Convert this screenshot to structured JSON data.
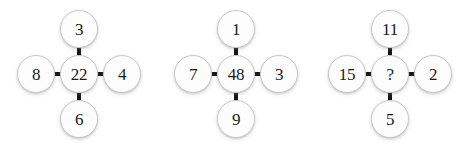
{
  "puzzle": {
    "type": "number-cross-puzzle",
    "background_color": "#ffffff",
    "node_fill_color": "#fdfdfd",
    "node_border_color": "#c9c9c9",
    "edge_color": "#151515",
    "text_color": "#1a1a1a",
    "clusters": [
      {
        "name": "cluster-1",
        "top": "3",
        "left": "8",
        "center": "22",
        "right": "4",
        "bottom": "6"
      },
      {
        "name": "cluster-2",
        "top": "1",
        "left": "7",
        "center": "48",
        "right": "3",
        "bottom": "9"
      },
      {
        "name": "cluster-3",
        "top": "11",
        "left": "15",
        "center": "?",
        "right": "2",
        "bottom": "5"
      }
    ]
  }
}
